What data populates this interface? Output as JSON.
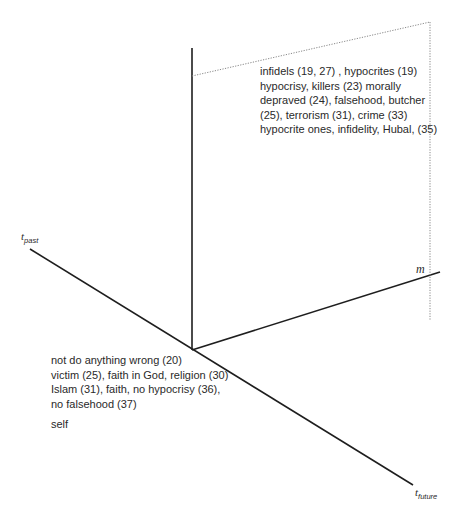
{
  "axes": {
    "past_label": "t",
    "past_sub": "past",
    "future_label": "t",
    "future_sub": "future",
    "m_label": "m"
  },
  "upper_block": {
    "lines": [
      "infidels (19, 27) , hypocrites (19)",
      "hypocrisy, killers (23) morally",
      "depraved (24), falsehood, butcher",
      "(25), terrorism (31), crime (33)",
      "hypocrite ones, infidelity, Hubal, (35)"
    ]
  },
  "lower_block": {
    "lines": [
      "not do anything wrong (20)",
      "victim (25), faith in God, religion (30)",
      "Islam (31), faith, no hypocrisy (36),",
      "no falsehood (37)"
    ],
    "self_label": "self"
  },
  "colors": {
    "axis": "#1e1e1e",
    "dotted": "#888888"
  }
}
